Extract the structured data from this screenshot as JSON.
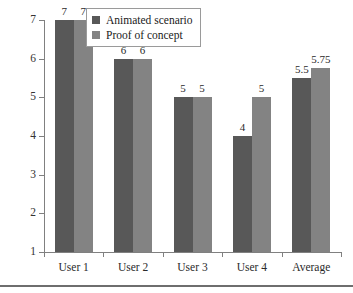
{
  "chart_data": {
    "type": "bar",
    "title": "",
    "subtitle": "",
    "xlabel": "",
    "ylabel": "",
    "categories": [
      "User 1",
      "User 2",
      "User 3",
      "User 4",
      "Average"
    ],
    "series": [
      {
        "name": "Animated scenario",
        "color": "#585858",
        "values": [
          7,
          6,
          5,
          4,
          5.5
        ],
        "labels": [
          "7",
          "6",
          "5",
          "4",
          "5.5"
        ]
      },
      {
        "name": "Proof of concept",
        "color": "#838383",
        "values": [
          7,
          6,
          5,
          5,
          5.75
        ],
        "labels": [
          "7",
          "6",
          "5",
          "5",
          "5.75"
        ]
      }
    ],
    "ylim": [
      1,
      7
    ],
    "yticks": [
      1,
      2,
      3,
      4,
      5,
      6,
      7
    ],
    "ytick_labels": [
      "1",
      "2",
      "3",
      "4",
      "5",
      "6",
      "7"
    ],
    "grid": false,
    "legend_position": "top-left",
    "axis_color": "#808080"
  },
  "legend": {
    "entries": [
      {
        "label": "Animated scenario"
      },
      {
        "label": "Proof of concept"
      }
    ]
  }
}
